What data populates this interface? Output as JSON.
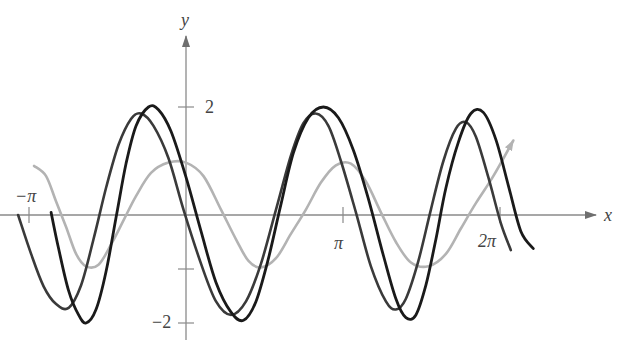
{
  "chart_data": {
    "type": "line",
    "title": "",
    "xlabel": "x",
    "ylabel": "y",
    "x_ticks": [
      {
        "value": -3.1416,
        "label": "−π"
      },
      {
        "value": 3.1416,
        "label": "π"
      },
      {
        "value": 6.2832,
        "label": "2π"
      }
    ],
    "y_ticks": [
      {
        "value": 2,
        "label": "2"
      },
      {
        "value": -1,
        "label": ""
      },
      {
        "value": -2,
        "label": "−2"
      }
    ],
    "xlim": [
      -3.7,
      8.0
    ],
    "ylim": [
      -2.4,
      2.9
    ],
    "grid": false,
    "legend": null,
    "series": [
      {
        "name": "light gray curve (amplitude 1, ends with arrow)",
        "color": "#b3b3b3",
        "width": 2.6,
        "arrow_end": true,
        "points": [
          [
            -3.04,
            0.91
          ],
          [
            -2.8,
            0.72
          ],
          [
            -2.6,
            0.25
          ],
          [
            -2.4,
            -0.22
          ],
          [
            -2.2,
            -0.72
          ],
          [
            -2.0,
            -0.95
          ],
          [
            -1.75,
            -0.92
          ],
          [
            -1.5,
            -0.55
          ],
          [
            -1.25,
            -0.1
          ],
          [
            -1.0,
            0.35
          ],
          [
            -0.7,
            0.78
          ],
          [
            -0.35,
            0.97
          ],
          [
            0.0,
            0.97
          ],
          [
            0.35,
            0.72
          ],
          [
            0.7,
            0.1
          ],
          [
            1.0,
            -0.45
          ],
          [
            1.25,
            -0.85
          ],
          [
            1.5,
            -0.97
          ],
          [
            1.8,
            -0.8
          ],
          [
            2.1,
            -0.35
          ],
          [
            2.4,
            0.1
          ],
          [
            2.7,
            0.6
          ],
          [
            3.0,
            0.92
          ],
          [
            3.3,
            0.95
          ],
          [
            3.6,
            0.62
          ],
          [
            3.9,
            0.05
          ],
          [
            4.2,
            -0.5
          ],
          [
            4.5,
            -0.88
          ],
          [
            4.85,
            -0.95
          ],
          [
            5.2,
            -0.72
          ],
          [
            5.5,
            -0.25
          ],
          [
            5.8,
            0.22
          ],
          [
            6.15,
            0.72
          ],
          [
            6.55,
            1.38
          ]
        ]
      },
      {
        "name": "medium-dark curve (amplitude ~2)",
        "color": "#3a3a3a",
        "width": 2.6,
        "arrow_end": false,
        "points": [
          [
            -3.36,
            0.0
          ],
          [
            -3.1,
            -0.72
          ],
          [
            -2.85,
            -1.32
          ],
          [
            -2.6,
            -1.65
          ],
          [
            -2.35,
            -1.72
          ],
          [
            -2.1,
            -1.3
          ],
          [
            -1.85,
            -0.45
          ],
          [
            -1.6,
            0.5
          ],
          [
            -1.35,
            1.3
          ],
          [
            -1.1,
            1.78
          ],
          [
            -0.9,
            1.88
          ],
          [
            -0.65,
            1.65
          ],
          [
            -0.35,
            1.05
          ],
          [
            -0.05,
            0.1
          ],
          [
            0.3,
            -0.9
          ],
          [
            0.6,
            -1.6
          ],
          [
            0.9,
            -1.85
          ],
          [
            1.2,
            -1.6
          ],
          [
            1.5,
            -0.9
          ],
          [
            1.8,
            0.1
          ],
          [
            2.1,
            1.1
          ],
          [
            2.35,
            1.7
          ],
          [
            2.6,
            1.88
          ],
          [
            2.85,
            1.65
          ],
          [
            3.1,
            1.0
          ],
          [
            3.4,
            0.05
          ],
          [
            3.7,
            -0.95
          ],
          [
            4.0,
            -1.6
          ],
          [
            4.2,
            -1.75
          ],
          [
            4.4,
            -1.55
          ],
          [
            4.65,
            -0.85
          ],
          [
            4.9,
            0.1
          ],
          [
            5.15,
            1.0
          ],
          [
            5.4,
            1.6
          ],
          [
            5.6,
            1.72
          ],
          [
            5.8,
            1.45
          ],
          [
            6.05,
            0.7
          ],
          [
            6.3,
            -0.15
          ],
          [
            6.5,
            -0.65
          ]
        ]
      },
      {
        "name": "black curve (amplitude 2)",
        "color": "#1a1a1a",
        "width": 2.8,
        "arrow_end": false,
        "points": [
          [
            -2.7,
            0.05
          ],
          [
            -2.55,
            -0.62
          ],
          [
            -2.35,
            -1.4
          ],
          [
            -2.15,
            -1.85
          ],
          [
            -2.0,
            -2.0
          ],
          [
            -1.8,
            -1.75
          ],
          [
            -1.6,
            -1.05
          ],
          [
            -1.4,
            -0.05
          ],
          [
            -1.2,
            0.95
          ],
          [
            -1.0,
            1.65
          ],
          [
            -0.75,
            2.0
          ],
          [
            -0.55,
            1.95
          ],
          [
            -0.3,
            1.55
          ],
          [
            0.0,
            0.7
          ],
          [
            0.3,
            -0.3
          ],
          [
            0.6,
            -1.25
          ],
          [
            0.9,
            -1.8
          ],
          [
            1.15,
            -1.95
          ],
          [
            1.4,
            -1.6
          ],
          [
            1.65,
            -0.8
          ],
          [
            1.9,
            0.2
          ],
          [
            2.15,
            1.15
          ],
          [
            2.45,
            1.8
          ],
          [
            2.75,
            2.0
          ],
          [
            3.05,
            1.8
          ],
          [
            3.35,
            1.2
          ],
          [
            3.65,
            0.3
          ],
          [
            3.95,
            -0.75
          ],
          [
            4.2,
            -1.55
          ],
          [
            4.4,
            -1.9
          ],
          [
            4.6,
            -1.85
          ],
          [
            4.8,
            -1.3
          ],
          [
            5.0,
            -0.45
          ],
          [
            5.2,
            0.5
          ],
          [
            5.45,
            1.35
          ],
          [
            5.7,
            1.88
          ],
          [
            5.95,
            1.9
          ],
          [
            6.2,
            1.4
          ],
          [
            6.45,
            0.55
          ],
          [
            6.7,
            -0.3
          ],
          [
            6.95,
            -0.62
          ]
        ]
      }
    ]
  },
  "axes": {
    "x_label": "x",
    "y_label": "y",
    "axis_color": "#8a8a8a",
    "label_color": "#444444"
  }
}
